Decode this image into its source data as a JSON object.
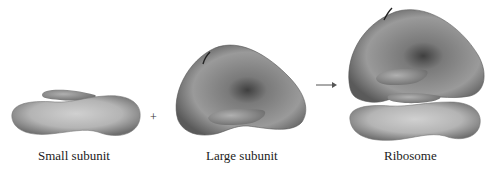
{
  "diagram": {
    "labels": {
      "small": "Small subunit",
      "large": "Large subunit",
      "ribosome": "Ribosome"
    },
    "operators": {
      "plus": "+",
      "arrow": "→"
    },
    "colors": {
      "background": "#ffffff",
      "shape_light": "#c4c4c4",
      "shape_mid": "#8a8a8a",
      "shape_dark": "#4a4a4a",
      "text": "#222222"
    }
  }
}
